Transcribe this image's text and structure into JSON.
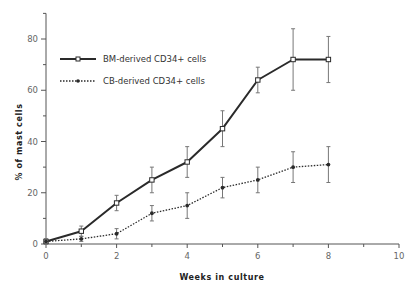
{
  "chart_data": {
    "type": "line",
    "title": "",
    "xlabel": "Weeks  in  culture",
    "ylabel": "% of mast cells",
    "xlim": [
      0,
      10
    ],
    "ylim": [
      0,
      90
    ],
    "xticks": [
      0,
      2,
      4,
      6,
      8,
      10
    ],
    "yticks": [
      0,
      20,
      40,
      60,
      80
    ],
    "grid": false,
    "legend_position": "upper-left",
    "x": [
      0,
      1,
      2,
      3,
      4,
      5,
      6,
      7,
      8
    ],
    "series": [
      {
        "name": "BM-derived CD34+ cells",
        "style": "solid",
        "marker": "open-square",
        "values": [
          1,
          5,
          16,
          25,
          32,
          45,
          64,
          72,
          72
        ],
        "error_low": [
          0,
          3,
          13,
          20,
          26,
          38,
          59,
          60,
          63
        ],
        "error_high": [
          2,
          7,
          19,
          30,
          38,
          52,
          69,
          84,
          81
        ]
      },
      {
        "name": "CB-derived CD34+ cells",
        "style": "dotted",
        "marker": "filled-diamond",
        "values": [
          1,
          2,
          4,
          12,
          15,
          22,
          25,
          30,
          31
        ],
        "error_low": [
          0,
          1,
          2,
          9,
          10,
          18,
          20,
          24,
          24
        ],
        "error_high": [
          2,
          3,
          6,
          15,
          20,
          26,
          30,
          36,
          38
        ]
      }
    ]
  },
  "legend": {
    "items": [
      {
        "label": "BM-derived CD34+ cells"
      },
      {
        "label": "CB-derived CD34+ cells"
      }
    ]
  },
  "axes": {
    "x_title": "Weeks  in  culture",
    "y_title": "% of mast cells",
    "x_tick_labels": [
      "0",
      "2",
      "4",
      "6",
      "8",
      "10"
    ],
    "y_tick_labels": [
      "0",
      "20",
      "40",
      "60",
      "80"
    ]
  },
  "colors": {
    "axis": "#555555",
    "series_line": "#2a2a2a",
    "error_bar": "#777777"
  }
}
